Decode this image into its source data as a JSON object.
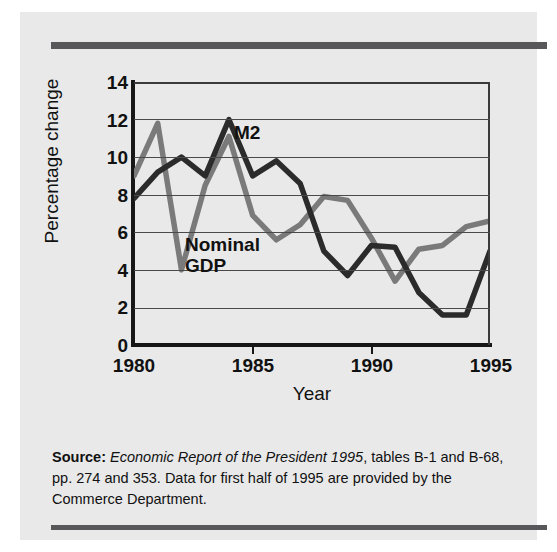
{
  "figure": {
    "background_color": "#e9e9e9",
    "rule_color": "#58585a"
  },
  "caption": {
    "source_label": "Source:",
    "source_italic": "Economic Report of the President 1995",
    "source_rest": ", tables B-1 and B-68, pp. 274 and 353. Data for first half of 1995 are provided by the Commerce Department."
  },
  "chart_data": {
    "type": "line",
    "title": "",
    "xlabel": "Year",
    "ylabel": "Percentage change",
    "xlim": [
      1980,
      1995
    ],
    "ylim": [
      0,
      14
    ],
    "xticks": [
      1980,
      1985,
      1990,
      1995
    ],
    "xtick_labels": [
      "1980",
      "1985",
      "1990",
      "1995"
    ],
    "yticks": [
      0,
      2,
      4,
      6,
      8,
      10,
      12,
      14
    ],
    "ytick_labels": [
      "0",
      "2",
      "4",
      "6",
      "8",
      "10",
      "12",
      "14"
    ],
    "grid": true,
    "grid_axis": "y",
    "legend_position": "inline-annotation",
    "x": [
      1980,
      1981,
      1982,
      1983,
      1984,
      1985,
      1986,
      1987,
      1988,
      1989,
      1990,
      1991,
      1992,
      1993,
      1994,
      1995
    ],
    "series": [
      {
        "name": "M2",
        "color": "#2b2b2b",
        "label_text": "M2",
        "values": [
          7.8,
          9.2,
          10.0,
          9.0,
          12.0,
          9.0,
          9.8,
          8.6,
          5.0,
          3.7,
          5.3,
          5.2,
          2.8,
          1.6,
          1.6,
          5.0
        ]
      },
      {
        "name": "Nominal GDP",
        "color": "#7a7a7a",
        "label_text": "Nominal\nGDP",
        "label_line1": "Nominal",
        "label_line2": "GDP",
        "values": [
          9.0,
          11.8,
          4.0,
          8.5,
          11.1,
          6.9,
          5.6,
          6.4,
          7.9,
          7.7,
          5.7,
          3.4,
          5.1,
          5.3,
          6.3,
          6.6
        ]
      }
    ]
  }
}
